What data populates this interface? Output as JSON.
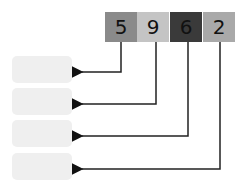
{
  "digits": [
    {
      "value": "5",
      "color": "#8a8a8a"
    },
    {
      "value": "9",
      "color": "#c4c4c4"
    },
    {
      "value": "6",
      "color": "#3a3a3a"
    },
    {
      "value": "2",
      "color": "#a9a9a9"
    }
  ],
  "answer_boxes": [
    "",
    "",
    "",
    ""
  ]
}
